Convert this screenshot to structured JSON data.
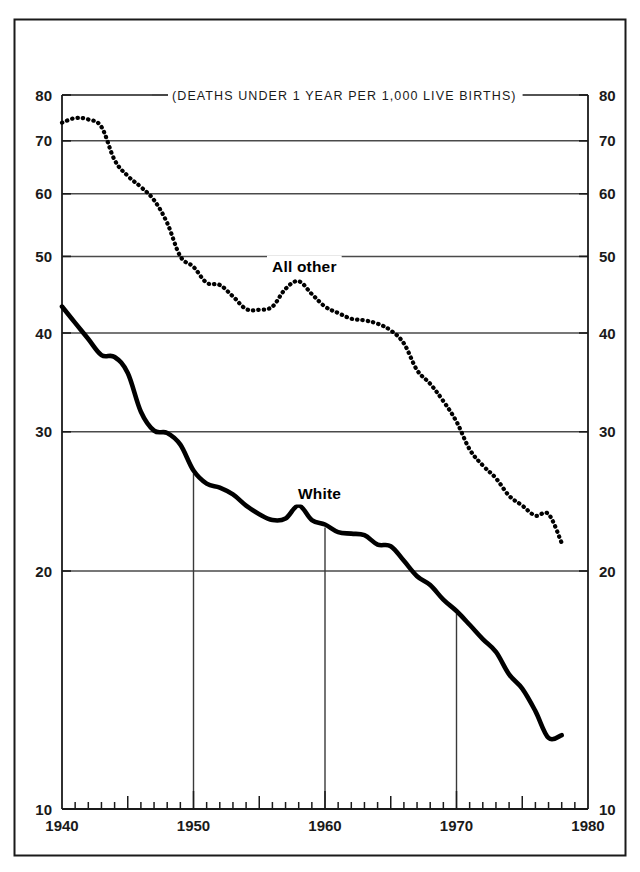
{
  "figure": {
    "unit_note": "(DEATHS UNDER 1 YEAR PER 1,000 LIVE BIRTHS)",
    "frame_color": "#1a1a1a",
    "grid_color": "#4a4a4a",
    "line_color": "#000000"
  },
  "axes": {
    "y_scale": "log",
    "y_ticks": [
      10,
      20,
      30,
      40,
      50,
      60,
      70,
      80
    ],
    "y_tick_labels_left": [
      "10",
      "20",
      "30",
      "40",
      "50",
      "60",
      "70",
      "80"
    ],
    "y_tick_labels_right": [
      "10",
      "20",
      "30",
      "40",
      "50",
      "60",
      "70",
      "80"
    ],
    "ylim": [
      10,
      80
    ],
    "x_ticks_major": [
      1940,
      1950,
      1960,
      1970,
      1980
    ],
    "x_tick_labels": [
      "1940",
      "1950",
      "1960",
      "1970",
      "1980"
    ],
    "x_minor_step": 1,
    "x_medium": [
      1945,
      1955,
      1965,
      1975
    ],
    "xlim": [
      1940,
      1980
    ],
    "vertical_gridlines": [
      1950,
      1960,
      1970
    ]
  },
  "labels": {
    "all_other": "All other",
    "white": "White"
  },
  "chart_data": {
    "type": "line",
    "title": "",
    "subtitle": "(DEATHS UNDER 1 YEAR PER 1,000 LIVE BIRTHS)",
    "xlabel": "",
    "ylabel": "",
    "ylim": [
      10,
      80
    ],
    "xlim": [
      1940,
      1980
    ],
    "yscale": "log",
    "grid": true,
    "legend": "inline-annotation",
    "x": [
      1940,
      1941,
      1942,
      1943,
      1944,
      1945,
      1946,
      1947,
      1948,
      1949,
      1950,
      1951,
      1952,
      1953,
      1954,
      1955,
      1956,
      1957,
      1958,
      1959,
      1960,
      1961,
      1962,
      1963,
      1964,
      1965,
      1966,
      1967,
      1968,
      1969,
      1970,
      1971,
      1972,
      1973,
      1974,
      1975,
      1976,
      1977,
      1978
    ],
    "series": [
      {
        "name": "All other",
        "style": "dotted",
        "values": [
          73.8,
          74.8,
          74.5,
          72.9,
          66.2,
          63.2,
          61.2,
          58.9,
          55.1,
          50.0,
          48.5,
          46.3,
          46.0,
          44.5,
          42.9,
          42.8,
          43.2,
          45.5,
          46.5,
          44.8,
          43.2,
          42.4,
          41.7,
          41.5,
          41.1,
          40.3,
          38.8,
          35.9,
          34.5,
          32.8,
          30.9,
          28.5,
          27.2,
          26.2,
          24.9,
          24.2,
          23.5,
          23.6,
          21.7
        ]
      },
      {
        "name": "White",
        "style": "solid",
        "values": [
          43.2,
          41.2,
          39.3,
          37.5,
          37.3,
          35.6,
          31.8,
          30.1,
          29.9,
          28.9,
          26.8,
          25.8,
          25.5,
          25.0,
          24.2,
          23.6,
          23.2,
          23.3,
          24.2,
          23.2,
          22.9,
          22.4,
          22.3,
          22.2,
          21.6,
          21.5,
          20.6,
          19.7,
          19.2,
          18.4,
          17.8,
          17.1,
          16.4,
          15.8,
          14.8,
          14.2,
          13.3,
          12.3,
          12.4
        ]
      }
    ]
  }
}
